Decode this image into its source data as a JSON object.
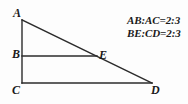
{
  "figure": {
    "background_color": "#fdfdfd",
    "stroke_color": "#2b2b2b",
    "label_color": "#1a1a1a"
  },
  "vertices": {
    "A": {
      "label": "A",
      "x": 22,
      "y": 20
    },
    "B": {
      "label": "B",
      "x": 22,
      "y": 56
    },
    "C": {
      "label": "C",
      "x": 22,
      "y": 83
    },
    "D": {
      "label": "D",
      "x": 152,
      "y": 83
    },
    "E": {
      "label": "E",
      "x": 97,
      "y": 56
    }
  },
  "segments": [
    {
      "name": "AC",
      "from": "A",
      "to": "C"
    },
    {
      "name": "AD",
      "from": "A",
      "to": "D"
    },
    {
      "name": "CD",
      "from": "C",
      "to": "D"
    },
    {
      "name": "BE",
      "from": "B",
      "to": "E"
    }
  ],
  "annotations": {
    "line1": "AB:AC=2:3",
    "line2": "BE:CD=2:3"
  }
}
